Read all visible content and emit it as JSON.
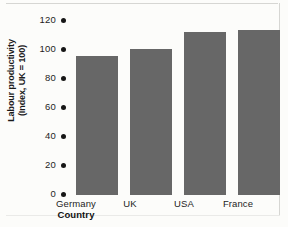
{
  "chart_data": {
    "type": "bar",
    "title": "",
    "categories": [
      "Germany",
      "UK",
      "USA",
      "France"
    ],
    "values": [
      95,
      100,
      112,
      113
    ],
    "series": [
      {
        "name": "Labour productivity",
        "values": [
          95,
          100,
          112,
          113
        ]
      }
    ],
    "xlabel": "Country",
    "ylabel": "Labour productivity (Index, UK = 100)",
    "ylabel_lines": [
      "Labour productivity",
      "(Index, UK = 100)"
    ],
    "ylim": [
      0,
      120
    ],
    "yticks": [
      120,
      100,
      80,
      60,
      40,
      20,
      0
    ],
    "ytick_labels": [
      "120",
      "100",
      "80",
      "60",
      "40",
      "20",
      "0"
    ],
    "tick_marker": "filled-dot",
    "grid": false,
    "legend": false,
    "bar_color": "#676767",
    "background_color": "#fcfcfa",
    "text_color": "#1d1d1d"
  }
}
